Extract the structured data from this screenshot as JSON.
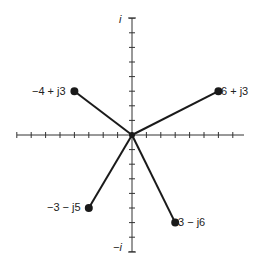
{
  "diagram": {
    "type": "complex-plane-phasors",
    "axes": {
      "imag_pos_label": "i",
      "imag_neg_label": "−i",
      "x_ticks": 16,
      "y_ticks": 16
    },
    "points": [
      {
        "label": "−4 + j3",
        "re": -4,
        "im": 3
      },
      {
        "label": "6 + j3",
        "re": 6,
        "im": 3
      },
      {
        "label": "−3 − j5",
        "re": -3,
        "im": -5
      },
      {
        "label": "3 − j6",
        "re": 3,
        "im": -6
      }
    ],
    "colors": {
      "line": "#1a1a1a",
      "axis": "#333333"
    }
  }
}
